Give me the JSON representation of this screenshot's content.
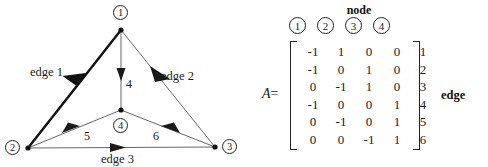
{
  "figure": {
    "graph": {
      "nodes": [
        {
          "id": "1",
          "label": "1",
          "x": 121,
          "y": 30,
          "circle_x": 121,
          "circle_y": 13
        },
        {
          "id": "2",
          "label": "2",
          "x": 28,
          "y": 148,
          "circle_x": 13,
          "circle_y": 148
        },
        {
          "id": "3",
          "label": "3",
          "x": 215,
          "y": 147,
          "circle_x": 230,
          "circle_y": 147
        },
        {
          "id": "4",
          "label": "4",
          "x": 121,
          "y": 110,
          "circle_x": 121,
          "circle_y": 126
        }
      ],
      "edges": [
        {
          "id": 1,
          "label": "edge 1",
          "from": "1",
          "to": "2",
          "emphasis": "bold",
          "label_x": 30,
          "label_y": 73
        },
        {
          "id": 2,
          "label": "edge 2",
          "from": "1",
          "to": "3",
          "emphasis": "normal",
          "label_x": 161,
          "label_y": 77
        },
        {
          "id": 3,
          "label": "edge 3",
          "from": "2",
          "to": "3",
          "emphasis": "normal",
          "label_x": 101,
          "label_y": 160
        },
        {
          "id": 4,
          "label": "4",
          "from": "1",
          "to": "4",
          "emphasis": "normal",
          "label_x": 126,
          "label_y": 85
        },
        {
          "id": 5,
          "label": "5",
          "from": "2",
          "to": "4",
          "emphasis": "normal",
          "label_x": 84,
          "label_y": 137
        },
        {
          "id": 6,
          "label": "6",
          "from": "3",
          "to": "4",
          "emphasis": "normal",
          "label_x": 153,
          "label_y": 137
        }
      ]
    },
    "matrix": {
      "name": "A",
      "equals": "=",
      "column_group_label": "node",
      "column_headers": [
        "1",
        "2",
        "3",
        "4"
      ],
      "row_group_label": "edge",
      "row_headers": [
        "1",
        "2",
        "3",
        "4",
        "5",
        "6"
      ],
      "rows": [
        [
          "-1",
          "1",
          "0",
          "0"
        ],
        [
          "-1",
          "0",
          "1",
          "0"
        ],
        [
          "0",
          "-1",
          "1",
          "0"
        ],
        [
          "-1",
          "0",
          "0",
          "1"
        ],
        [
          "0",
          "-1",
          "0",
          "1"
        ],
        [
          "0",
          "0",
          "-1",
          "1"
        ]
      ]
    },
    "colors": {
      "ink": "#1a1a1a",
      "line": "#555555",
      "bold_line": "#111111",
      "background": "#ffffff"
    }
  }
}
